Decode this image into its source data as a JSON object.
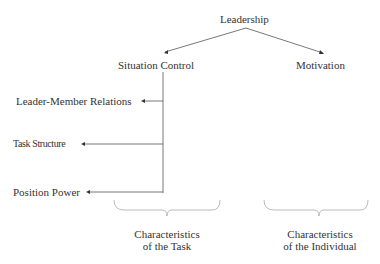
{
  "diagram": {
    "root": {
      "label": "Leadership"
    },
    "branches": [
      {
        "label": "Situation Control",
        "children": [
          {
            "label": "Leader-Member Relations"
          },
          {
            "label": "Task Structure"
          },
          {
            "label": "Position Power"
          }
        ],
        "group_caption": {
          "line1": "Characteristics",
          "line2": "of the Task"
        }
      },
      {
        "label": "Motivation",
        "group_caption": {
          "line1": "Characteristics",
          "line2": "of the Individual"
        }
      }
    ],
    "colors": {
      "line": "#555555",
      "brace": "#aaaaaa",
      "text": "#333333"
    }
  }
}
